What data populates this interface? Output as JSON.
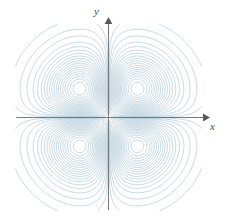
{
  "figure": {
    "name": "contour-plot",
    "background_color": "#ffffff",
    "width": 229,
    "height": 221
  },
  "axes": {
    "x_label": "x",
    "y_label": "y",
    "axis_color": "#7a7a7a",
    "origin_px": [
      108,
      117
    ],
    "x_axis_extent_px": [
      16,
      205
    ],
    "y_axis_extent_px": [
      22,
      210
    ],
    "arrowheads": [
      "x-positive",
      "y-positive"
    ],
    "ticks": [],
    "tick_labels": []
  },
  "chart_data": {
    "type": "contour",
    "title": "",
    "xlabel": "x",
    "ylabel": "y",
    "xlim": [
      -2.3,
      2.3
    ],
    "ylim": [
      -2.3,
      2.3
    ],
    "grid": false,
    "legend": false,
    "function": "f(x,y) = x*y*exp(-x^2-y^2)",
    "line_color": "#7fa8bf",
    "line_width": 0.5,
    "contour_levels": [
      -0.175,
      -0.165,
      -0.155,
      -0.145,
      -0.135,
      -0.125,
      -0.115,
      -0.105,
      -0.095,
      -0.085,
      -0.075,
      -0.065,
      -0.055,
      -0.045,
      -0.035,
      -0.025,
      -0.015,
      -0.008,
      -0.003,
      0.003,
      0.008,
      0.015,
      0.025,
      0.035,
      0.045,
      0.055,
      0.065,
      0.075,
      0.085,
      0.095,
      0.105,
      0.115,
      0.125,
      0.135,
      0.145,
      0.155,
      0.165,
      0.175
    ],
    "extrema": [
      {
        "label": "max-upper-right",
        "x": 0.707,
        "y": 0.707,
        "value": 0.1839,
        "pixel": [
          146,
          82
        ]
      },
      {
        "label": "min-upper-left",
        "x": -0.707,
        "y": 0.707,
        "value": -0.1839,
        "pixel": [
          70,
          82
        ]
      },
      {
        "label": "min-lower-right",
        "x": 0.707,
        "y": -0.707,
        "value": -0.1839,
        "pixel": [
          146,
          153
        ]
      },
      {
        "label": "max-lower-left",
        "x": -0.707,
        "y": -0.707,
        "value": 0.1839,
        "pixel": [
          70,
          153
        ]
      }
    ],
    "lobes": 4,
    "lobe_quadrants": [
      "upper-left",
      "upper-right",
      "lower-left",
      "lower-right"
    ]
  }
}
